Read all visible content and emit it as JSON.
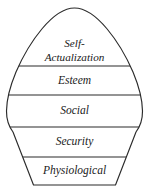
{
  "diagram": {
    "name": "maslow-hierarchy-of-needs",
    "shape": "rounded-pentagon",
    "background_color": "#ffffff",
    "line_color": "#2b2b2b",
    "text_color": "#1a1a1a",
    "tiers": [
      {
        "id": "self-actualization",
        "label": "Self-Actualization",
        "label_line1": "Self-",
        "label_line2": "Actualization",
        "order": 5,
        "position": "top",
        "fill": "white",
        "hatched": false
      },
      {
        "id": "esteem",
        "label": "Esteem",
        "order": 4,
        "position": "upper-middle",
        "fill": "white",
        "hatched": false
      },
      {
        "id": "social",
        "label": "Social",
        "order": 3,
        "position": "middle",
        "fill": "hatched",
        "hatched": true,
        "hatch_angle_degrees": 45,
        "hatch_spacing_px": 12
      },
      {
        "id": "security",
        "label": "Security",
        "order": 2,
        "position": "lower-middle",
        "fill": "white",
        "hatched": false
      },
      {
        "id": "physiological",
        "label": "Physiological",
        "order": 1,
        "position": "bottom",
        "fill": "white",
        "hatched": false
      }
    ],
    "divider_y_positions": [
      66,
      95,
      127,
      157
    ],
    "widest_y": 111,
    "apex_y": 8,
    "base_y": 185
  }
}
